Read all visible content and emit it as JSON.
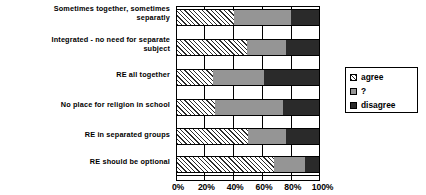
{
  "chart_data": {
    "type": "bar",
    "orientation": "horizontal",
    "stacked": true,
    "stacked_mode": "percent",
    "title": "",
    "xlabel": "",
    "ylabel": "",
    "xlim": [
      0,
      100
    ],
    "grid": true,
    "legend_position": "right",
    "xticks": [
      0,
      20,
      40,
      60,
      80,
      100
    ],
    "xticklabels": [
      "0%",
      "20%",
      "40%",
      "60%",
      "80%",
      "100%"
    ],
    "categories": [
      "Sometimes together, sometimes separatly",
      "Integrated - no need for separate subject",
      "RE all together",
      "No place for religion in school",
      "RE in separated groups",
      "RE should be optional"
    ],
    "series": [
      {
        "name": "agree",
        "color": "#ffffff",
        "pattern": "diagonal-hatch",
        "values": [
          40,
          49,
          25,
          27,
          50,
          68
        ]
      },
      {
        "name": "?",
        "color": "#959595",
        "pattern": "solid",
        "values": [
          40,
          28,
          36,
          48,
          27,
          22
        ]
      },
      {
        "name": "disagree",
        "color": "#2a2a2a",
        "pattern": "solid",
        "values": [
          20,
          23,
          39,
          25,
          23,
          10
        ]
      }
    ]
  },
  "legend": {
    "items": [
      {
        "label": "agree",
        "swatch": "hatch-swatch"
      },
      {
        "label": "?",
        "swatch": "gray-swatch"
      },
      {
        "label": "disagree",
        "swatch": "black-swatch"
      }
    ]
  },
  "labels": {
    "cat0_line1": "Sometimes together, sometimes",
    "cat0_line2": "separatly",
    "cat1_line1": "Integrated - no need for separate",
    "cat1_line2": "subject",
    "cat2": "RE all together",
    "cat3": "No place for religion in school",
    "cat4": "RE in separated groups",
    "cat5": "RE should be optional"
  },
  "axis": {
    "tick0": "0%",
    "tick1": "20%",
    "tick2": "40%",
    "tick3": "60%",
    "tick4": "80%",
    "tick5": "100%"
  }
}
